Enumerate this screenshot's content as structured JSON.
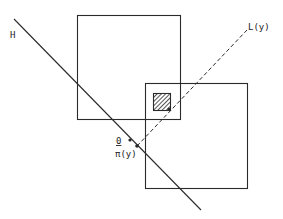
{
  "labels": {
    "H": "H",
    "L": "L(y)",
    "O": "0",
    "pi": "π(y)"
  },
  "colors": {
    "stroke": "#2a2a2a",
    "background": "#ffffff"
  }
}
